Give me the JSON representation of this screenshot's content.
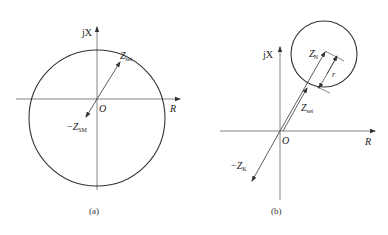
{
  "figure_a": {
    "caption": "(a)",
    "y_axis_label": "jX",
    "x_axis_label": "R",
    "origin_label": "O",
    "vector_set": {
      "main": "Z",
      "sub": "set"
    },
    "vector_neg": {
      "prefix": "−",
      "main": "Z",
      "sub": "SM"
    }
  },
  "figure_b": {
    "caption": "(b)",
    "y_axis_label": "jX",
    "x_axis_label": "R",
    "origin_label": "O",
    "vector_center": {
      "main": "Z",
      "sub": "N",
      "prime": "'"
    },
    "radius_label": "r",
    "vector_set": {
      "main": "Z",
      "sub": "set"
    },
    "vector_neg": {
      "prefix": "−",
      "main": "Z",
      "sub": "K"
    }
  },
  "colors": {
    "stroke": "#333333",
    "background": "#ffffff"
  }
}
